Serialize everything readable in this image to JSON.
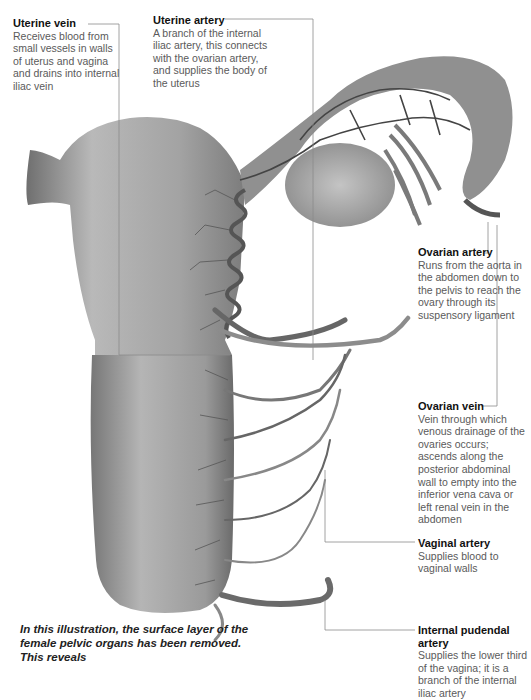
{
  "labels": {
    "uterine_vein": {
      "title": "Uterine vein",
      "description": "Receives blood from small vessels in walls of uterus and vagina and drains into internal iliac vein"
    },
    "uterine_artery": {
      "title": "Uterine artery",
      "description": "A branch of the internal iliac artery, this connects with the ovarian artery, and supplies the body of the uterus"
    },
    "ovarian_artery": {
      "title": "Ovarian artery",
      "description": "Runs from the aorta in the abdomen down to the pelvis to reach the ovary through its suspensory ligament"
    },
    "ovarian_vein": {
      "title": "Ovarian vein",
      "description": "Vein through which venous drainage of the ovaries occurs; ascends along the posterior abdominal wall to empty into the inferior vena cava or left renal vein in the abdomen"
    },
    "vaginal_artery": {
      "title": "Vaginal artery",
      "description": "Supplies blood to vaginal walls"
    },
    "internal_pudendal_artery": {
      "title": "Internal pudendal artery",
      "description": "Supplies the lower third of the vagina; it is a branch of the internal iliac artery"
    }
  },
  "caption": "In this illustration, the surface layer of the female pelvic organs has been removed. This reveals",
  "colors": {
    "organ": "#9a9a9a",
    "vessel_dark": "#4a4a4a",
    "vessel_light": "#8c8c8c",
    "leader": "#8a8a8a",
    "title": "#111111",
    "text": "#5a5a5a"
  }
}
